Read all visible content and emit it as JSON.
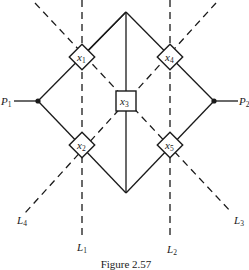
{
  "figure": {
    "caption": "Figure 2.57",
    "nodes": [
      {
        "id": "x1",
        "base": "x",
        "sub": "1",
        "shape": "diamond",
        "cx": 82,
        "cy": 57
      },
      {
        "id": "x2",
        "base": "x",
        "sub": "2",
        "shape": "diamond",
        "cx": 82,
        "cy": 145
      },
      {
        "id": "x3",
        "base": "x",
        "sub": "3",
        "shape": "square",
        "cx": 126,
        "cy": 101
      },
      {
        "id": "x4",
        "base": "x",
        "sub": "4",
        "shape": "diamond",
        "cx": 170,
        "cy": 57
      },
      {
        "id": "x5",
        "base": "x",
        "sub": "5",
        "shape": "diamond",
        "cx": 170,
        "cy": 145
      }
    ],
    "terminals": [
      {
        "id": "P1",
        "base": "P",
        "sub": "1"
      },
      {
        "id": "P2",
        "base": "P",
        "sub": "2"
      }
    ],
    "lines": [
      {
        "id": "L1",
        "base": "L",
        "sub": "1"
      },
      {
        "id": "L2",
        "base": "L",
        "sub": "2"
      },
      {
        "id": "L3",
        "base": "L",
        "sub": "3"
      },
      {
        "id": "L4",
        "base": "L",
        "sub": "4"
      }
    ]
  }
}
